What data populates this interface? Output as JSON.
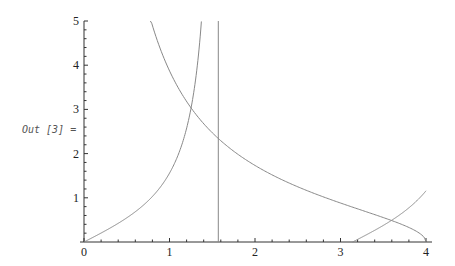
{
  "output_label": "Out [3] =",
  "chart_data": {
    "type": "line",
    "title": "",
    "xlabel": "",
    "ylabel": "",
    "xlim": [
      0,
      4
    ],
    "ylim": [
      0,
      5
    ],
    "x_ticks": [
      "0",
      "1",
      "2",
      "3",
      "4"
    ],
    "y_ticks": [
      "1",
      "2",
      "3",
      "4",
      "5"
    ],
    "grid": false,
    "legend": null,
    "series": [
      {
        "name": "tan(x)",
        "expression": "tan(x)",
        "segments": [
          [
            0,
            1.373
          ],
          [
            3.142,
            4.0
          ]
        ],
        "samples": [
          [
            0,
            0
          ],
          [
            0.5,
            0.546
          ],
          [
            1.0,
            1.557
          ],
          [
            1.2,
            2.572
          ],
          [
            1.3,
            3.602
          ],
          [
            1.373,
            5.0
          ],
          [
            3.142,
            0
          ],
          [
            3.5,
            0.375
          ],
          [
            4.0,
            1.158
          ]
        ]
      },
      {
        "name": "sqrt(16-x^2)/x",
        "expression": "sqrt(16-x^2)/x",
        "segments": [
          [
            0.776,
            4.0
          ]
        ],
        "samples": [
          [
            0.776,
            5.0
          ],
          [
            1.0,
            3.873
          ],
          [
            1.5,
            2.472
          ],
          [
            2.0,
            1.732
          ],
          [
            3.0,
            0.882
          ],
          [
            3.5,
            0.553
          ],
          [
            4.0,
            0
          ]
        ]
      },
      {
        "name": "asymptote x = pi/2",
        "expression": "x = 1.5708",
        "segments": [
          [
            1.5708,
            1.5708
          ]
        ]
      }
    ],
    "colors": {
      "curve": "#888888",
      "axis": "#333333"
    }
  }
}
